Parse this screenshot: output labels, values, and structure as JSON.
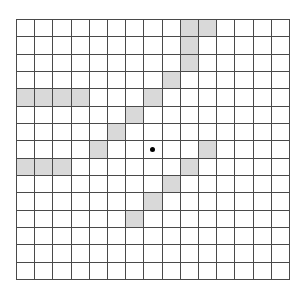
{
  "diagram": {
    "type": "grid",
    "rows": 15,
    "cols": 15,
    "colors": {
      "line": "#4a4a4a",
      "shaded": "#d9d9d9",
      "empty": "#ffffff",
      "dot": "#000000"
    },
    "shaded_cells": [
      [
        0,
        9
      ],
      [
        0,
        10
      ],
      [
        1,
        9
      ],
      [
        2,
        9
      ],
      [
        3,
        8
      ],
      [
        4,
        0
      ],
      [
        4,
        1
      ],
      [
        4,
        2
      ],
      [
        4,
        3
      ],
      [
        4,
        7
      ],
      [
        5,
        6
      ],
      [
        6,
        5
      ],
      [
        7,
        4
      ],
      [
        7,
        10
      ],
      [
        8,
        0
      ],
      [
        8,
        1
      ],
      [
        8,
        2
      ],
      [
        8,
        9
      ],
      [
        9,
        8
      ],
      [
        10,
        7
      ],
      [
        11,
        6
      ]
    ],
    "dot": {
      "row": 7,
      "col": 7
    }
  }
}
